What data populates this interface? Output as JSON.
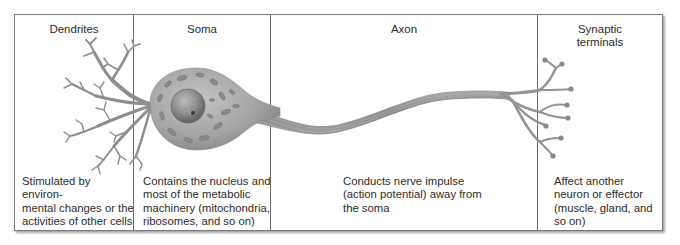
{
  "diagram": {
    "type": "labeled neuron structure",
    "colors": {
      "border": "#6e6e6e",
      "neuron_fill": "#9a9a9a",
      "neuron_dark": "#7d7d7d",
      "text": "#2c2c2c",
      "background": "#ffffff"
    },
    "columns": [
      {
        "id": "dendrites",
        "title": "Dendrites",
        "description": [
          "Stimulated by environ-",
          "mental changes or the",
          "activities of other cells"
        ]
      },
      {
        "id": "soma",
        "title": "Soma",
        "description": [
          "Contains the nucleus and",
          "most of the metabolic",
          "machinery (mitochondria,",
          "ribosomes, and so on)"
        ]
      },
      {
        "id": "axon",
        "title": "Axon",
        "description": [
          "Conducts nerve impulse",
          "(action potential) away from",
          "the soma"
        ]
      },
      {
        "id": "synaptic-terminals",
        "title_lines": [
          "Synaptic",
          "terminals"
        ],
        "description": [
          "Affect another",
          "neuron or effector",
          "(muscle, gland, and",
          "so on)"
        ]
      }
    ]
  }
}
